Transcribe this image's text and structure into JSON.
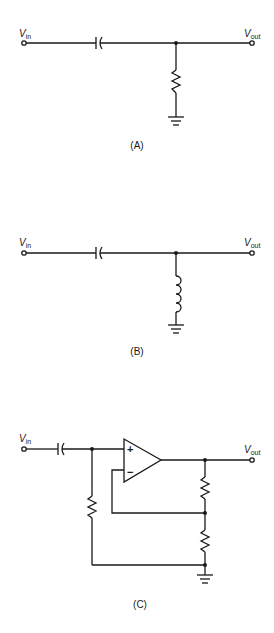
{
  "figure": {
    "panels": [
      {
        "id": "A",
        "caption": "(A)",
        "input_label": {
          "main": "V",
          "sub": "in"
        },
        "output_label": {
          "main": "V",
          "sub": "out"
        },
        "components": [
          "capacitor",
          "resistor",
          "ground"
        ]
      },
      {
        "id": "B",
        "caption": "(B)",
        "input_label": {
          "main": "V",
          "sub": "in"
        },
        "output_label": {
          "main": "V",
          "sub": "out"
        },
        "components": [
          "capacitor",
          "inductor",
          "ground"
        ]
      },
      {
        "id": "C",
        "caption": "(C)",
        "input_label": {
          "main": "V",
          "sub": "in"
        },
        "output_label": {
          "main": "V",
          "sub": "out"
        },
        "opamp": {
          "plus": "+",
          "minus": "−"
        },
        "components": [
          "capacitor",
          "resistor",
          "op-amp",
          "resistor",
          "resistor",
          "ground"
        ]
      }
    ]
  }
}
